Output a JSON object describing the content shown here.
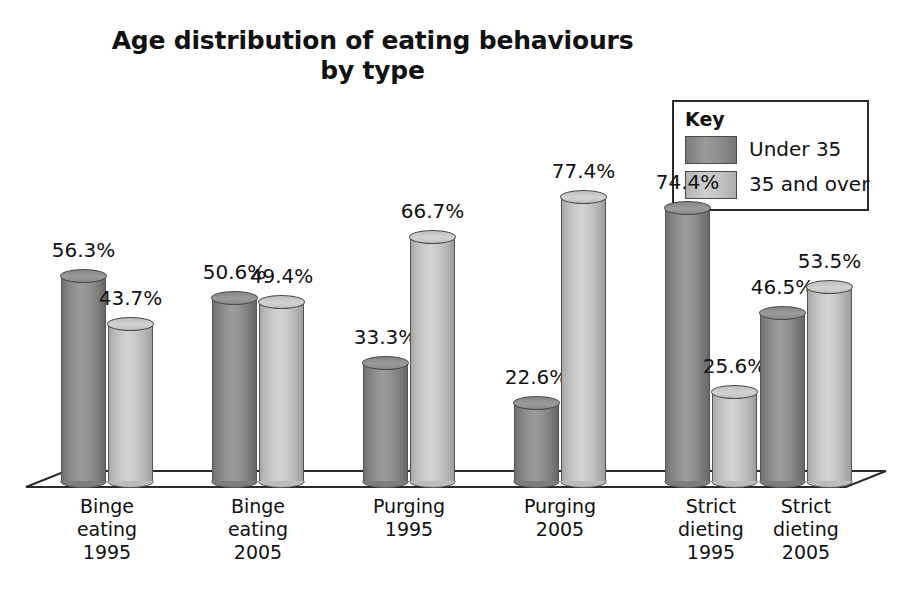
{
  "chart_data": {
    "type": "bar",
    "title": "Age distribution of eating behaviours by type",
    "title_line1": "Age distribution of eating behaviours",
    "title_line2": "by type",
    "xlabel": "",
    "ylabel": "",
    "ylim": [
      0,
      100
    ],
    "grid": false,
    "legend_position": "top-right",
    "legend_title": "Key",
    "value_suffix": "%",
    "categories": [
      "Binge eating 1995",
      "Binge eating 2005",
      "Purging 1995",
      "Purging 2005",
      "Strict dieting 1995",
      "Strict dieting 2005"
    ],
    "category_lines": [
      [
        "Binge",
        "eating",
        "1995"
      ],
      [
        "Binge",
        "eating",
        "2005"
      ],
      [
        "Purging",
        "1995"
      ],
      [
        "Purging",
        "2005"
      ],
      [
        "Strict",
        "dieting",
        "1995"
      ],
      [
        "Strict",
        "dieting",
        "2005"
      ]
    ],
    "series": [
      {
        "name": "Under 35",
        "color": "#8d8d8d",
        "values": [
          56.3,
          50.6,
          33.3,
          22.6,
          74.4,
          46.5
        ],
        "labels": [
          "56.3%",
          "50.6%",
          "33.3%",
          "22.6%",
          "74.4%",
          "46.5%"
        ]
      },
      {
        "name": "35 and over",
        "color": "#c6c6c6",
        "values": [
          43.7,
          49.4,
          66.7,
          77.4,
          25.6,
          53.5
        ],
        "labels": [
          "43.7%",
          "49.4%",
          "66.7%",
          "77.4%",
          "25.6%",
          "53.5%"
        ]
      }
    ]
  },
  "legend": {
    "title": "Key",
    "entries": [
      {
        "label": "Under 35",
        "swatch": "dark-gray-swatch"
      },
      {
        "label": "35 and over",
        "swatch": "light-gray-swatch"
      }
    ]
  },
  "title": {
    "line1": "Age distribution of eating behaviours",
    "line2": "by type"
  }
}
